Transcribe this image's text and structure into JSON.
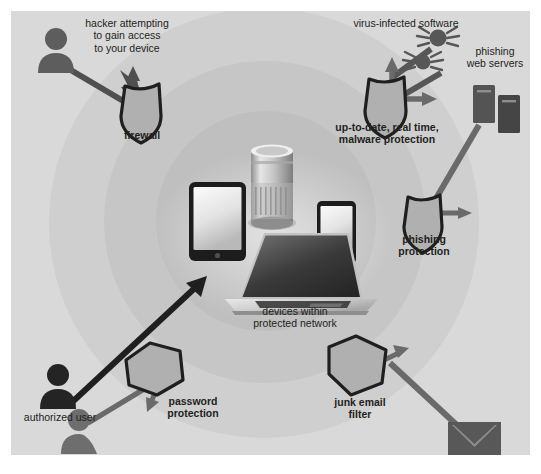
{
  "diagram": {
    "background_color": "#d9d9d9",
    "ring_colors": [
      "#cfcfcf",
      "#c6c6c6",
      "#bfbfbf"
    ],
    "ink_color": "#231f20",
    "threat_color": "#575757",
    "shield_fill": "#b3b3b3",
    "center": {
      "label": "devices within\nprotected network",
      "devices": [
        {
          "name": "tablet",
          "label": "tablet"
        },
        {
          "name": "smart-speaker",
          "label": "smart speaker"
        },
        {
          "name": "smartphone",
          "label": "smartphone"
        },
        {
          "name": "laptop",
          "label": "laptop"
        }
      ]
    },
    "threats": [
      {
        "id": "hacker",
        "label": "hacker attempting\nto gain access\nto your device",
        "icon": "person-icon",
        "defense": "firewall"
      },
      {
        "id": "virus",
        "label": "virus-infected software",
        "icon": "spider-virus-icon",
        "defense": "malware-protection"
      },
      {
        "id": "phishing-servers",
        "label": "phishing\nweb servers",
        "icon": "server-icon",
        "defense": "phishing-protection"
      },
      {
        "id": "spam",
        "label": "spam",
        "icon": "envelope-icon",
        "defense": "junk-email-filter"
      },
      {
        "id": "unauthorized-user",
        "label": "unauthorized user",
        "icon": "person-icon",
        "defense": "password-protection"
      }
    ],
    "allowed": [
      {
        "id": "authorized-user",
        "label": "authorized user",
        "icon": "person-icon"
      }
    ],
    "defenses": [
      {
        "id": "firewall",
        "label": "firewall",
        "shape": "shield"
      },
      {
        "id": "malware-protection",
        "label": "up-to-date, real time,\nmalware protection",
        "shape": "shield"
      },
      {
        "id": "phishing-protection",
        "label": "phishing\nprotection",
        "shape": "shield"
      },
      {
        "id": "junk-email-filter",
        "label": "junk email\nfilter",
        "shape": "pentagon"
      },
      {
        "id": "password-protection",
        "label": "password\nprotection",
        "shape": "pentagon"
      }
    ]
  }
}
